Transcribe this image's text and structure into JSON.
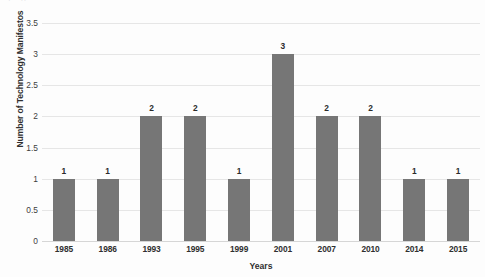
{
  "chart_data": {
    "type": "bar",
    "title": "",
    "xlabel": "Years",
    "ylabel": "Number of Technology Manifestos",
    "categories": [
      "1985",
      "1986",
      "1993",
      "1995",
      "1999",
      "2001",
      "2007",
      "2010",
      "2014",
      "2015"
    ],
    "values": [
      1,
      1,
      2,
      2,
      1,
      3,
      2,
      2,
      1,
      1
    ],
    "data_labels": [
      "1",
      "1",
      "2",
      "2",
      "1",
      "3",
      "2",
      "2",
      "1",
      "1"
    ],
    "ylim": [
      0,
      3.5
    ],
    "ytick_values": [
      0,
      0.5,
      1,
      1.5,
      2,
      2.5,
      3,
      3.5
    ],
    "ytick_labels": [
      "0",
      "0.5",
      "1",
      "1.5",
      "2",
      "2.5",
      "3",
      "3.5"
    ],
    "grid": true,
    "legend": false,
    "legend_position": "none",
    "bar_color": "#767676",
    "gridline_color": "#e6e6e6",
    "background_color": "#fdfdfd",
    "text_color": "#2f2f2f"
  },
  "artifact": {
    "top_row_text": "‧    ⁖        ‧            ⁙        ‧"
  }
}
